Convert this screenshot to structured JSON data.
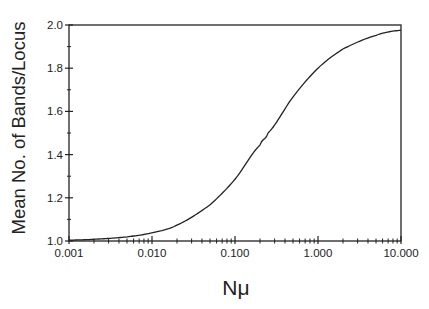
{
  "chart_data": {
    "type": "line",
    "title": "",
    "xlabel": "Nμ",
    "ylabel": "Mean No. of Bands/Locus",
    "xscale": "log",
    "xlim": [
      0.001,
      10.0
    ],
    "ylim": [
      1.0,
      2.0
    ],
    "grid": false,
    "legend": null,
    "x_tick_labels": [
      "0.001",
      "0.010",
      "0.100",
      "1.000",
      "10.000"
    ],
    "x_ticks": [
      0.001,
      0.01,
      0.1,
      1.0,
      10.0
    ],
    "y_tick_labels": [
      "1.0",
      "1.2",
      "1.4",
      "1.6",
      "1.8",
      "2.0"
    ],
    "y_ticks": [
      1.0,
      1.2,
      1.4,
      1.6,
      1.8,
      2.0
    ],
    "series": [
      {
        "name": "Mean bands per locus",
        "x": [
          0.001,
          0.002,
          0.005,
          0.01,
          0.02,
          0.05,
          0.1,
          0.2,
          0.25,
          0.5,
          1.0,
          2.0,
          5.0,
          10.0
        ],
        "values": [
          1.004,
          1.008,
          1.019,
          1.038,
          1.074,
          1.167,
          1.286,
          1.444,
          1.5,
          1.667,
          1.8,
          1.889,
          1.952,
          1.976
        ]
      }
    ],
    "colors": {
      "line": "#222222",
      "axis": "#222222",
      "background": "#ffffff"
    }
  }
}
